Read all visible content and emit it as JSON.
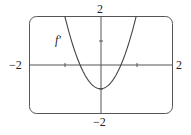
{
  "chart_data": {
    "type": "line",
    "title": "",
    "xlabel": "",
    "ylabel": "",
    "xlim": [
      -2,
      2
    ],
    "ylim": [
      -2,
      2
    ],
    "grid": false,
    "series": [
      {
        "name": "f'",
        "formula": "3x^2 - 1",
        "x": [
          -1.0,
          -0.8,
          -0.6,
          -0.4,
          -0.2,
          0,
          0.2,
          0.4,
          0.6,
          0.8,
          1.0
        ],
        "y": [
          2.0,
          0.92,
          0.08,
          -0.52,
          -0.88,
          -1.0,
          -0.88,
          -0.52,
          0.08,
          0.92,
          2.0
        ]
      }
    ],
    "tick_labels": {
      "x_left": "−2",
      "x_right": "2",
      "y_top": "2",
      "y_bottom": "−2"
    },
    "annotations": [
      {
        "text": "f′",
        "x": -1.3,
        "y": 1.4
      }
    ]
  },
  "labels": {
    "x_left": "−2",
    "x_right": "2",
    "y_top": "2",
    "y_bottom": "−2",
    "curve": "f′"
  }
}
